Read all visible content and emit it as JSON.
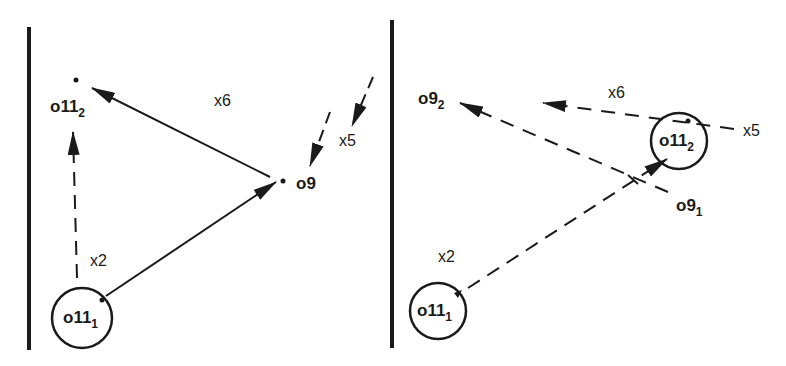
{
  "diagram": {
    "panels": [
      {
        "id": "left",
        "nodes": {
          "o11_2": {
            "base": "o11",
            "sub": "2"
          },
          "o11_1": {
            "base": "o11",
            "sub": "1"
          },
          "o9": {
            "base": "o9"
          }
        },
        "edges": {
          "x2": {
            "label": "x2",
            "from": "o11_1",
            "to": "o11_2",
            "style": "dashed"
          },
          "x6": {
            "label": "x6",
            "from": "o9",
            "to": "o11_2",
            "style": "solid"
          },
          "x5": {
            "label": "x5",
            "to": "o9",
            "style": "dashed"
          },
          "o11_1_to_o9": {
            "from": "o11_1",
            "to": "o9",
            "style": "solid"
          }
        }
      },
      {
        "id": "right",
        "nodes": {
          "o9_2": {
            "base": "o9",
            "sub": "2"
          },
          "o11_2": {
            "base": "o11",
            "sub": "2"
          },
          "o9_1": {
            "base": "o9",
            "sub": "1"
          },
          "o11_1": {
            "base": "o11",
            "sub": "1"
          }
        },
        "edges": {
          "x2": {
            "label": "x2",
            "from": "o11_1",
            "to": "o11_2",
            "style": "dashed"
          },
          "x6": {
            "label": "x6",
            "from": "o11_2",
            "style": "dashed"
          },
          "x5": {
            "label": "x5",
            "style": "dashed"
          },
          "o9_1_to_o9_2": {
            "from": "o9_1",
            "to": "o9_2",
            "style": "dashed"
          }
        }
      }
    ],
    "colors": {
      "ink": "#1a1a1a",
      "background": "#ffffff"
    }
  }
}
